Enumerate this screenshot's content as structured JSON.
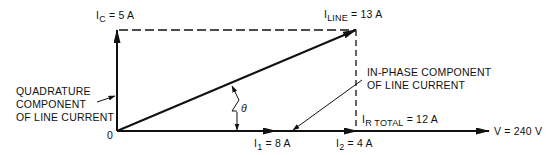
{
  "diagram": {
    "origin_label": "0",
    "vectors": {
      "quadrature": {
        "symbol": "I",
        "subscript": "C",
        "value": "= 5 A"
      },
      "line": {
        "symbol": "I",
        "subscript": "LINE",
        "value": "= 13 A"
      },
      "i1": {
        "symbol": "I",
        "subscript": "1",
        "value": "= 8 A"
      },
      "i2": {
        "symbol": "I",
        "subscript": "2",
        "value": "= 4 A"
      },
      "r_total": {
        "symbol": "I",
        "subscript": "R TOTAL",
        "value": "= 12 A"
      },
      "voltage": {
        "label": "V = 240 V"
      }
    },
    "annotations": {
      "quadrature_line1": "QUADRATURE",
      "quadrature_line2": "COMPONENT",
      "quadrature_line3": "OF LINE CURRENT",
      "inphase_line1": "IN-PHASE COMPONENT",
      "inphase_line2": "OF LINE CURRENT",
      "angle": "θ"
    },
    "colors": {
      "ink": "#111111",
      "background": "#ffffff"
    }
  }
}
